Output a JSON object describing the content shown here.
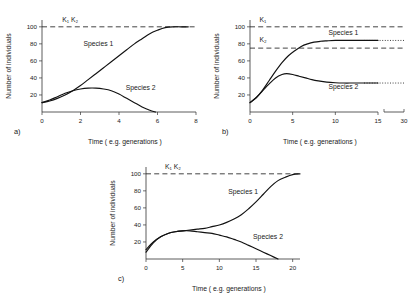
{
  "figure": {
    "axis_titles": {
      "x": "Time ( e.g. generations )",
      "y": "Number of individuals"
    },
    "series_names": {
      "s1": "Species 1",
      "s2": "Species 2"
    },
    "k_labels": {
      "k1_base": "K",
      "k1_sub": "1",
      "k2_base": "K",
      "k2_sub": "2"
    }
  },
  "chart_data": [
    {
      "type": "line",
      "panel": "a",
      "panel_letter": "a)",
      "title": "",
      "xlabel": "Time ( e.g. generations )",
      "ylabel": "Number of individuals",
      "xlim": [
        0,
        8
      ],
      "ylim": [
        0,
        108
      ],
      "xticks": [
        0,
        2,
        4,
        6,
        8
      ],
      "yticks": [
        20,
        40,
        60,
        80,
        100
      ],
      "grid": false,
      "legend": "inline-annotations",
      "carrying_capacities": [
        {
          "label": "K1",
          "value": 100,
          "style": "dashed"
        },
        {
          "label": "K2",
          "value": 100,
          "style": "dashed"
        }
      ],
      "annotations": [
        {
          "text": "K₁ K₂",
          "x": 1.05,
          "y": 106
        },
        {
          "text": "Species 1",
          "x": 2.15,
          "y": 78
        },
        {
          "text": "Species 2",
          "x": 4.35,
          "y": 26
        }
      ],
      "series": [
        {
          "name": "Species 1",
          "x": [
            0,
            0.4,
            0.8,
            1.2,
            1.6,
            2.0,
            2.4,
            2.8,
            3.2,
            3.6,
            4.0,
            4.4,
            4.8,
            5.2,
            5.6,
            6.0,
            6.4,
            6.8,
            7.2,
            7.6
          ],
          "values": [
            11,
            13,
            16,
            20,
            25,
            31,
            38,
            45,
            52,
            59,
            66,
            73,
            80,
            86,
            92,
            96,
            99,
            100,
            100,
            100
          ]
        },
        {
          "name": "Species 2",
          "x": [
            0,
            0.4,
            0.8,
            1.2,
            1.6,
            2.0,
            2.4,
            2.8,
            3.2,
            3.6,
            4.0,
            4.4,
            4.8,
            5.2,
            5.6,
            5.9
          ],
          "values": [
            11,
            14,
            18,
            22,
            25,
            27,
            28,
            28,
            27,
            25,
            21,
            16,
            11,
            6,
            2,
            0
          ]
        }
      ]
    },
    {
      "type": "line",
      "panel": "b",
      "panel_letter": "b)",
      "title": "",
      "xlabel": "Time ( e.g. generations )",
      "ylabel": "Number of individuals",
      "xlim": [
        0,
        15
      ],
      "ylim": [
        0,
        108
      ],
      "xticks": [
        0,
        5,
        10,
        15
      ],
      "xticks_after_break": [
        30
      ],
      "axis_break": true,
      "yticks": [
        20,
        40,
        60,
        80,
        100
      ],
      "grid": false,
      "legend": "inline-annotations",
      "carrying_capacities": [
        {
          "label": "K1",
          "value": 100,
          "style": "dashed"
        },
        {
          "label": "K2",
          "value": 75,
          "style": "dashed"
        }
      ],
      "equilibria": [
        {
          "series": "Species 1",
          "value": 84,
          "style": "dotted"
        },
        {
          "series": "Species 2",
          "value": 34,
          "style": "dotted"
        }
      ],
      "annotations": [
        {
          "text": "K₁",
          "x": 1.1,
          "y": 106
        },
        {
          "text": "K₂",
          "x": 1.1,
          "y": 82
        },
        {
          "text": "Species 1",
          "x": 9.2,
          "y": 90
        },
        {
          "text": "Species 2",
          "x": 9.2,
          "y": 27
        }
      ],
      "series": [
        {
          "name": "Species 1",
          "x": [
            0,
            0.75,
            1.5,
            2.25,
            3,
            3.75,
            4.5,
            5.25,
            6,
            6.75,
            7.5,
            8.25,
            9,
            10,
            11,
            12,
            13,
            14,
            15
          ],
          "values": [
            11,
            17,
            26,
            37,
            48,
            58,
            66,
            72,
            77,
            80,
            82,
            83,
            83.5,
            84,
            84,
            84,
            84,
            84,
            84
          ]
        },
        {
          "name": "Species 2",
          "x": [
            0,
            0.75,
            1.5,
            2.25,
            3,
            3.75,
            4.3,
            5,
            5.75,
            6.5,
            7.25,
            8,
            9,
            10,
            11,
            12,
            13,
            14,
            15
          ],
          "values": [
            11,
            17,
            25,
            33,
            40,
            44,
            45,
            44,
            42,
            40,
            38,
            36.5,
            35,
            34.3,
            34,
            34,
            34,
            34,
            34
          ]
        }
      ]
    },
    {
      "type": "line",
      "panel": "c",
      "panel_letter": "c)",
      "title": "",
      "xlabel": "Time ( e.g. generations )",
      "ylabel": "Number of individuals",
      "xlim": [
        0,
        21
      ],
      "ylim": [
        0,
        108
      ],
      "xticks": [
        0,
        5,
        10,
        15,
        20
      ],
      "yticks": [
        20,
        40,
        60,
        80,
        100
      ],
      "grid": false,
      "legend": "inline-annotations",
      "carrying_capacities": [
        {
          "label": "K1",
          "value": 100,
          "style": "dashed"
        },
        {
          "label": "K2",
          "value": 100,
          "style": "dashed"
        }
      ],
      "annotations": [
        {
          "text": "K₁ K₂",
          "x": 2.6,
          "y": 106
        },
        {
          "text": "Species 1",
          "x": 11.2,
          "y": 76
        },
        {
          "text": "Species 2",
          "x": 14.6,
          "y": 24
        }
      ],
      "series": [
        {
          "name": "Species 1",
          "x": [
            0,
            1,
            2,
            3,
            4,
            5,
            6,
            7,
            8,
            9,
            10,
            11,
            12,
            13,
            14,
            15,
            16,
            17,
            18,
            19,
            20,
            21
          ],
          "values": [
            11,
            20,
            26,
            30,
            32,
            33,
            34,
            35,
            36,
            38,
            40,
            43,
            47,
            52,
            59,
            67,
            76,
            85,
            92,
            96,
            99,
            100
          ]
        },
        {
          "name": "Species 2",
          "x": [
            0,
            1,
            2,
            3,
            4,
            5,
            6,
            7,
            8,
            9,
            10,
            11,
            12,
            13,
            14,
            15,
            16,
            17,
            18
          ],
          "values": [
            8,
            19,
            26,
            30,
            32,
            33,
            33,
            32,
            31,
            30,
            28,
            26,
            23,
            20,
            16,
            12,
            8,
            4,
            0
          ]
        }
      ]
    }
  ]
}
